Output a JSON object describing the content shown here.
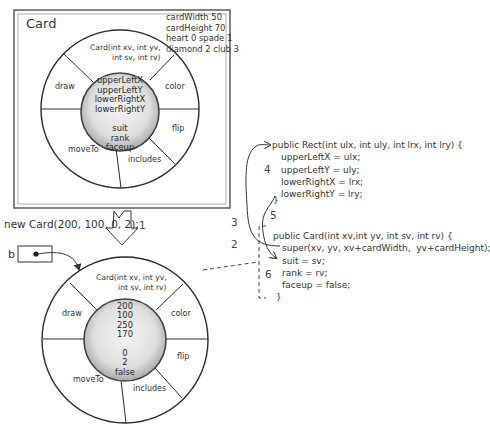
{
  "class_frame": {
    "title": "Card",
    "constants": [
      "cardWidth 50",
      "cardHeight 70",
      "heart 0 spade 1",
      "diamond 2 club 3"
    ],
    "constructor_label_line1": "Card(int xv, int yv,",
    "constructor_label_line2": "int sv, int rv)",
    "methods": {
      "draw": "draw",
      "color": "color",
      "flip": "flip",
      "includes": "includes",
      "moveTo": "moveTo"
    },
    "fields": [
      "upperLeftX",
      "upperLeftY",
      "lowerRightX",
      "lowerRightY",
      "",
      "suit",
      "rank",
      "faceup"
    ]
  },
  "instantiation": {
    "statement": "new Card(200, 100, 0, 2);",
    "step_label": "1"
  },
  "reference": {
    "variable_name": "b"
  },
  "instance": {
    "constructor_label_line1": "Card(int xv, int yv,",
    "constructor_label_line2": "int sv, int rv)",
    "methods": {
      "draw": "draw",
      "color": "color",
      "flip": "flip",
      "includes": "includes",
      "moveTo": "moveTo"
    },
    "field_values": [
      "200",
      "100",
      "250",
      "170",
      "",
      "0",
      "2",
      "false"
    ]
  },
  "steps": {
    "s2": "2",
    "s3": "3",
    "s4": "4",
    "s5": "5",
    "s6": "6"
  },
  "rect_constructor": {
    "signature": "public Rect(int ulx, int uly, int lrx, int lry) {",
    "body": [
      "upperLeftX = ulx;",
      "upperLeftY = uly;",
      "lowerRightX = lrx;",
      "lowerRightY = lry;"
    ],
    "close": "}"
  },
  "card_constructor": {
    "signature": "public Card(int xv,int yv, int sv, int rv) {",
    "body": [
      "super(xv, yv, xv+cardWidth,  yv+cardHeight);",
      "suit = sv;",
      "rank = rv;",
      "faceup = false;"
    ],
    "close": "}"
  },
  "colors": {
    "line": "#2b2b2b",
    "ring_fill": "#ffffff",
    "core_fill_center": "#f2f2f2",
    "core_fill_edge": "#b5b5b5"
  }
}
